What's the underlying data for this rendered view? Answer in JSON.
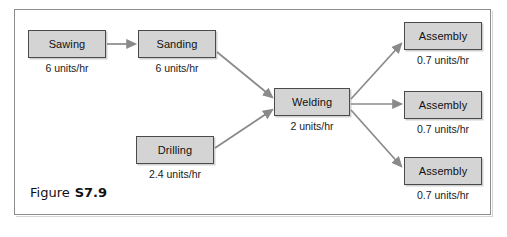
{
  "figure": {
    "caption_word": "Figure",
    "caption_number": "S7.9",
    "background_color": "#ffffff",
    "frame_color": "#8c8c8c",
    "box_fill_color": "#d4d4d4",
    "box_border_color": "#4a4a4a",
    "arrow_color": "#8a8a8a"
  },
  "diagram_data": {
    "type": "process-flow",
    "unit_suffix": "units/hr",
    "nodes": [
      {
        "id": "sawing",
        "label": "Sawing",
        "rate": "6 units/hr",
        "rate_value": 6,
        "x": 28,
        "y": 30,
        "w": 78,
        "h": 28,
        "rate_x": 28,
        "rate_y": 63
      },
      {
        "id": "sanding",
        "label": "Sanding",
        "rate": "6 units/hr",
        "rate_value": 6,
        "x": 138,
        "y": 30,
        "w": 78,
        "h": 28,
        "rate_x": 138,
        "rate_y": 63
      },
      {
        "id": "drilling",
        "label": "Drilling",
        "rate": "2.4 units/hr",
        "rate_value": 2.4,
        "x": 136,
        "y": 136,
        "w": 78,
        "h": 28,
        "rate_x": 136,
        "rate_y": 169
      },
      {
        "id": "welding",
        "label": "Welding",
        "rate": "2 units/hr",
        "rate_value": 2,
        "x": 274,
        "y": 88,
        "w": 76,
        "h": 28,
        "rate_x": 274,
        "rate_y": 121
      },
      {
        "id": "assembly-1",
        "label": "Assembly",
        "rate": "0.7 units/hr",
        "rate_value": 0.7,
        "x": 404,
        "y": 22,
        "w": 78,
        "h": 28,
        "rate_x": 404,
        "rate_y": 55
      },
      {
        "id": "assembly-2",
        "label": "Assembly",
        "rate": "0.7 units/hr",
        "rate_value": 0.7,
        "x": 404,
        "y": 91,
        "w": 78,
        "h": 28,
        "rate_x": 404,
        "rate_y": 124
      },
      {
        "id": "assembly-3",
        "label": "Assembly",
        "rate": "0.7 units/hr",
        "rate_value": 0.7,
        "x": 404,
        "y": 157,
        "w": 78,
        "h": 28,
        "rate_x": 404,
        "rate_y": 190
      }
    ],
    "edges": [
      {
        "from": "sawing",
        "to": "sanding",
        "x1": 107,
        "y1": 44,
        "x2": 135,
        "y2": 44
      },
      {
        "from": "sanding",
        "to": "welding",
        "x1": 217,
        "y1": 52,
        "x2": 272,
        "y2": 97
      },
      {
        "from": "drilling",
        "to": "welding",
        "x1": 215,
        "y1": 148,
        "x2": 272,
        "y2": 110
      },
      {
        "from": "welding",
        "to": "assembly-1",
        "x1": 351,
        "y1": 99,
        "x2": 401,
        "y2": 44
      },
      {
        "from": "welding",
        "to": "assembly-2",
        "x1": 351,
        "y1": 104,
        "x2": 401,
        "y2": 104
      },
      {
        "from": "welding",
        "to": "assembly-3",
        "x1": 351,
        "y1": 110,
        "x2": 401,
        "y2": 166
      }
    ]
  }
}
